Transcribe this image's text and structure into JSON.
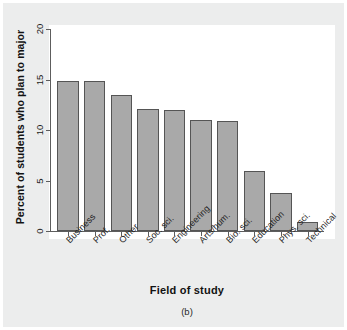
{
  "figure": {
    "caption": "(b)",
    "xlabel": "Field of study",
    "ylabel": "Percent of students who plan to major"
  },
  "axis": {
    "y_ticks": [
      "0",
      "5",
      "10",
      "15",
      "20"
    ]
  },
  "colors": {
    "bar_fill": "#a9a9a9",
    "bar_border": "#555555",
    "panel_background": "#ffffff",
    "page_background": "#eceded",
    "axis_line": "#5d5d5d",
    "text": "#1f1f1f"
  },
  "chart_data": {
    "type": "bar",
    "title": "",
    "xlabel": "Field of study",
    "ylabel": "Percent of students who plan to major",
    "categories": [
      "Business",
      "Prof.",
      "Other",
      "Soc. sci.",
      "Engineering",
      "Arts/hum.",
      "Bio. sci.",
      "Education",
      "Phys. sci.",
      "Technical"
    ],
    "values": [
      14.9,
      14.9,
      13.5,
      12.1,
      12.0,
      11.0,
      10.9,
      5.9,
      3.8,
      0.9
    ],
    "ylim": [
      0,
      20
    ],
    "yticks": [
      0,
      5,
      10,
      15,
      20
    ],
    "grid": false,
    "legend": false,
    "caption": "(b)"
  }
}
